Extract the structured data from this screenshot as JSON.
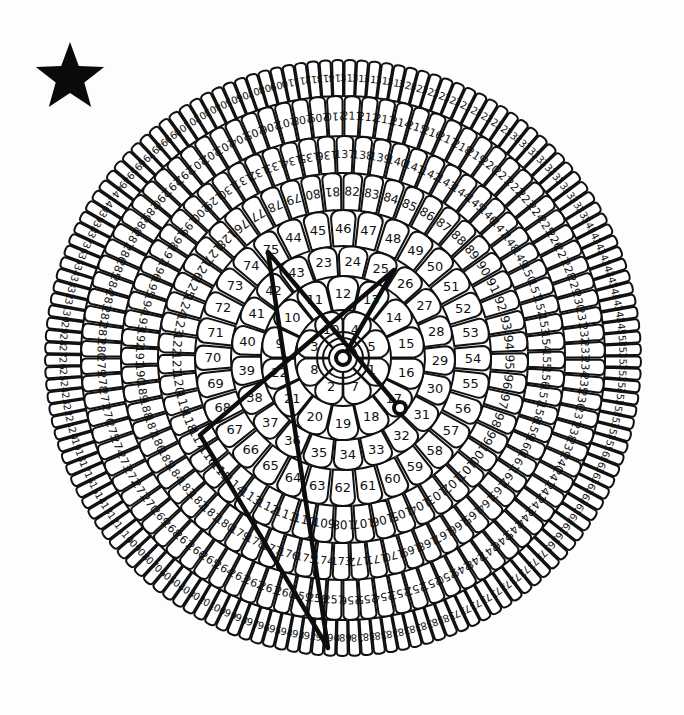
{
  "puzzle": {
    "type": "dot-to-dot flower",
    "center": [
      343,
      358
    ],
    "star_icon": {
      "cx": 70,
      "cy": 78,
      "r_outer": 36,
      "r_inner": 15,
      "color": "#0a0a0a"
    },
    "rings": [
      {
        "start": 1,
        "end": 8,
        "r_in": 14,
        "r_out": 48,
        "start_angle": 0,
        "font": 13,
        "order": [
          1,
          7,
          2,
          8,
          3,
          10,
          4,
          5
        ]
      },
      {
        "start": 9,
        "end": 22,
        "r_in": 48,
        "r_out": 82,
        "start_angle": 180,
        "font": 13
      },
      {
        "start": 23,
        "end": 43,
        "r_in": 82,
        "r_out": 112,
        "start_angle": -110,
        "font": 13
      },
      {
        "start": 44,
        "end": 75,
        "r_in": 112,
        "r_out": 148,
        "start_angle": -118,
        "font": 13
      },
      {
        "start": 76,
        "end": 128,
        "r_in": 148,
        "r_out": 185,
        "start_angle": -131,
        "font": 12
      },
      {
        "start": 129,
        "end": 200,
        "r_in": 185,
        "r_out": 222,
        "start_angle": -132,
        "font": 11
      },
      {
        "start": 201,
        "end": 292,
        "r_in": 222,
        "r_out": 262,
        "start_angle": -129,
        "font": 11
      },
      {
        "start": 293,
        "end": 441,
        "r_in": 262,
        "r_out": 298,
        "start_angle": -143,
        "font": 10
      }
    ],
    "drawn_path": {
      "description": "Connected lines drawn so far",
      "points": [
        [
          343,
          358
        ],
        [
          394,
          270
        ],
        [
          200,
          435
        ],
        [
          328,
          648
        ],
        [
          268,
          252
        ],
        [
          400,
          408
        ]
      ],
      "start_marker": {
        "cx": 343,
        "cy": 358,
        "r": 7
      },
      "end_marker": {
        "cx": 400,
        "cy": 408,
        "r": 6
      },
      "center_rings": [
        20,
        26
      ]
    }
  }
}
